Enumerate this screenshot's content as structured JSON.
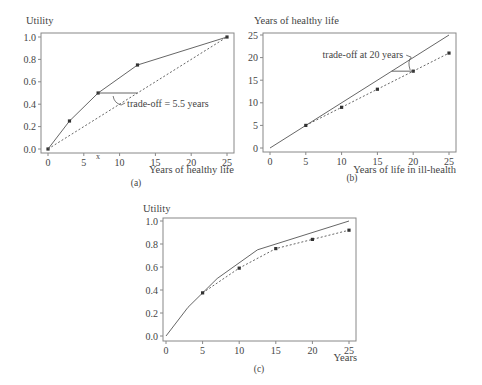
{
  "chart_data": [
    {
      "id": "a",
      "type": "line",
      "caption": "(a)",
      "ylabel": "Utility",
      "xlabel": "Years of healthy life",
      "xlim": [
        0,
        25
      ],
      "ylim": [
        0,
        1
      ],
      "xticks": [
        "0",
        "5",
        "10",
        "15",
        "20",
        "25"
      ],
      "yticks": [
        "0.0",
        "0.2",
        "0.4",
        "0.6",
        "0.8",
        "1.0"
      ],
      "series": [
        {
          "name": "utility curve",
          "style": "solid",
          "markers": true,
          "x": [
            0,
            3,
            7,
            12.5,
            25
          ],
          "y": [
            0,
            0.25,
            0.5,
            0.75,
            1.0
          ]
        },
        {
          "name": "linear reference",
          "style": "dotted",
          "markers": false,
          "x": [
            0,
            25
          ],
          "y": [
            0,
            1.0
          ]
        }
      ],
      "annotations": [
        {
          "text": "trade-off = 5.5 years",
          "from": [
            7,
            0.5
          ],
          "to": [
            12.5,
            0.5
          ]
        }
      ],
      "extra_tick_mark": {
        "x": 7,
        "label": "x"
      }
    },
    {
      "id": "b",
      "type": "line",
      "caption": "(b)",
      "ylabel": "Years of healthy life",
      "xlabel": "Years of life in ill-health",
      "xlim": [
        0,
        25
      ],
      "ylim": [
        0,
        25
      ],
      "xticks": [
        "0",
        "5",
        "10",
        "15",
        "20",
        "25"
      ],
      "yticks": [
        "0",
        "5",
        "10",
        "15",
        "20",
        "25"
      ],
      "series": [
        {
          "name": "identity line",
          "style": "solid",
          "markers": false,
          "x": [
            0,
            25
          ],
          "y": [
            0,
            25
          ]
        },
        {
          "name": "equivalent healthy years",
          "style": "dotted",
          "markers": true,
          "x": [
            5,
            10,
            15,
            20,
            25
          ],
          "y": [
            5,
            9,
            13,
            17,
            21
          ]
        }
      ],
      "annotations": [
        {
          "text": "trade-off at 20 years",
          "at": [
            20,
            17
          ]
        }
      ]
    },
    {
      "id": "c",
      "type": "line",
      "caption": "(c)",
      "ylabel": "Utility",
      "xlabel": "Years",
      "xlim": [
        0,
        25
      ],
      "ylim": [
        0,
        1
      ],
      "xticks": [
        "0",
        "5",
        "10",
        "15",
        "20",
        "25"
      ],
      "yticks": [
        "0.0",
        "0.2",
        "0.4",
        "0.6",
        "0.8",
        "1.0"
      ],
      "series": [
        {
          "name": "utility of healthy years",
          "style": "solid",
          "markers": false,
          "x": [
            0,
            3,
            7,
            12.5,
            25
          ],
          "y": [
            0,
            0.25,
            0.5,
            0.75,
            1.0
          ]
        },
        {
          "name": "utility of ill-health years",
          "style": "dotted",
          "markers": true,
          "x": [
            5,
            10,
            15,
            20,
            25
          ],
          "y": [
            0.375,
            0.59,
            0.76,
            0.84,
            0.92
          ]
        }
      ]
    }
  ]
}
